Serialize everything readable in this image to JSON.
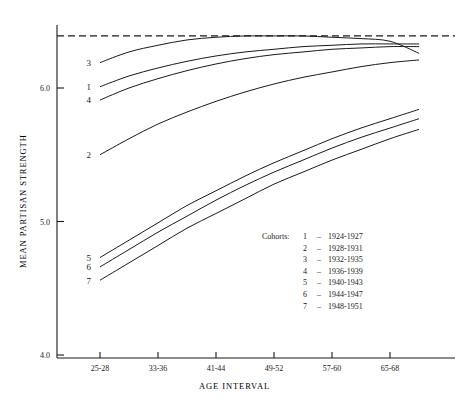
{
  "chart_data": {
    "type": "line",
    "title": "",
    "xlabel": "AGE INTERVAL",
    "ylabel": "MEAN PARTISAN STRENGTH",
    "ylim": [
      4.0,
      6.5
    ],
    "yticks": [
      4.0,
      5.0,
      6.0
    ],
    "ytick_labels": [
      "4.0",
      "5.0",
      "6.0"
    ],
    "xticks": [
      1,
      3,
      5,
      7,
      9,
      11
    ],
    "xtick_labels": [
      "25-28",
      "33-36",
      "41-44",
      "49-52",
      "57-60",
      "65-68"
    ],
    "grid": false,
    "legend_position": "inside-lower-right",
    "legend_title": "Cohorts:",
    "reference_line": {
      "type": "horizontal-dashed",
      "value": 6.39
    },
    "x": [
      1,
      2,
      3,
      4,
      5,
      6,
      7,
      8,
      9,
      10,
      11,
      12
    ],
    "series": [
      {
        "name": "3",
        "label": "1932-1935",
        "marker_label": "3",
        "values": [
          6.19,
          6.27,
          6.32,
          6.36,
          6.38,
          6.39,
          6.39,
          6.39,
          6.38,
          6.37,
          6.35,
          6.26
        ]
      },
      {
        "name": "1",
        "label": "1924-1927",
        "marker_label": "1",
        "values": [
          6.01,
          6.09,
          6.15,
          6.2,
          6.24,
          6.27,
          6.29,
          6.31,
          6.32,
          6.33,
          6.33,
          6.33
        ]
      },
      {
        "name": "4",
        "label": "1936-1939",
        "marker_label": "4",
        "values": [
          5.91,
          6.0,
          6.07,
          6.13,
          6.18,
          6.22,
          6.25,
          6.27,
          6.29,
          6.3,
          6.31,
          6.31
        ]
      },
      {
        "name": "2",
        "label": "1928-1931",
        "marker_label": "2",
        "values": [
          5.5,
          5.62,
          5.73,
          5.82,
          5.9,
          5.97,
          6.03,
          6.08,
          6.12,
          6.16,
          6.19,
          6.21
        ]
      },
      {
        "name": "5",
        "label": "1940-1943",
        "marker_label": "5",
        "values": [
          4.73,
          4.86,
          4.99,
          5.12,
          5.23,
          5.34,
          5.44,
          5.53,
          5.62,
          5.7,
          5.77,
          5.84
        ]
      },
      {
        "name": "6",
        "label": "1944-1947",
        "marker_label": "6",
        "values": [
          4.66,
          4.79,
          4.92,
          5.04,
          5.16,
          5.27,
          5.37,
          5.46,
          5.55,
          5.63,
          5.7,
          5.77
        ]
      },
      {
        "name": "7",
        "label": "1948-1951",
        "marker_label": "7",
        "values": [
          4.56,
          4.69,
          4.82,
          4.95,
          5.06,
          5.17,
          5.28,
          5.37,
          5.46,
          5.54,
          5.62,
          5.69
        ]
      }
    ],
    "legend_entries": [
      {
        "key": "1",
        "dash": "–",
        "range": "1924-1927"
      },
      {
        "key": "2",
        "dash": "–",
        "range": "1928-1931"
      },
      {
        "key": "3",
        "dash": "–",
        "range": "1932-1935"
      },
      {
        "key": "4",
        "dash": "–",
        "range": "1936-1939"
      },
      {
        "key": "5",
        "dash": "–",
        "range": "1940-1943"
      },
      {
        "key": "6",
        "dash": "–",
        "range": "1944-1947"
      },
      {
        "key": "7",
        "dash": "–",
        "range": "1948-1951"
      }
    ],
    "colors": {
      "line": "#1a1a1a",
      "axis": "#1a1a1a",
      "background": "#ffffff"
    }
  }
}
